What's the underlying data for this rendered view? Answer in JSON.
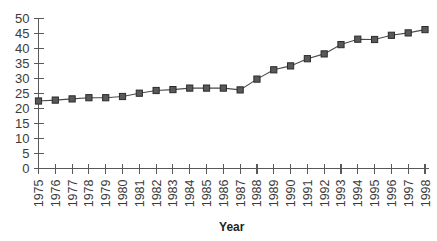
{
  "chart_data": {
    "type": "line",
    "title": "",
    "subtitle": "",
    "xlabel": "Year",
    "ylabel": "",
    "categories": [
      "1975",
      "1976",
      "1977",
      "1978",
      "1979",
      "1980",
      "1981",
      "1982",
      "1983",
      "1984",
      "1985",
      "1986",
      "1987",
      "1988",
      "1989",
      "1990",
      "1991",
      "1992",
      "1993",
      "1994",
      "1995",
      "1996",
      "1997",
      "1998"
    ],
    "values": [
      22.5,
      22.8,
      23.2,
      23.6,
      23.6,
      24.0,
      25.1,
      26.0,
      26.3,
      26.8,
      26.8,
      26.8,
      26.2,
      29.8,
      32.9,
      34.2,
      36.6,
      38.2,
      41.3,
      43.1,
      43.0,
      44.4,
      45.2,
      46.3
    ],
    "ylim": [
      0,
      50
    ],
    "ytick_labels": [
      "0",
      "5",
      "10",
      "15",
      "20",
      "25",
      "30",
      "35",
      "40",
      "45",
      "50"
    ],
    "ytick_values": [
      0,
      5,
      10,
      15,
      20,
      25,
      30,
      35,
      40,
      45,
      50
    ],
    "grid": false,
    "legend": false,
    "legend_position": "none",
    "marker": "square",
    "series_color": "#58595b",
    "line_color": "#4a4a4a",
    "axis_color": "#58595b",
    "text_color": "#3b3b3b",
    "background": "#ffffff",
    "xtick_rotation": -90
  }
}
